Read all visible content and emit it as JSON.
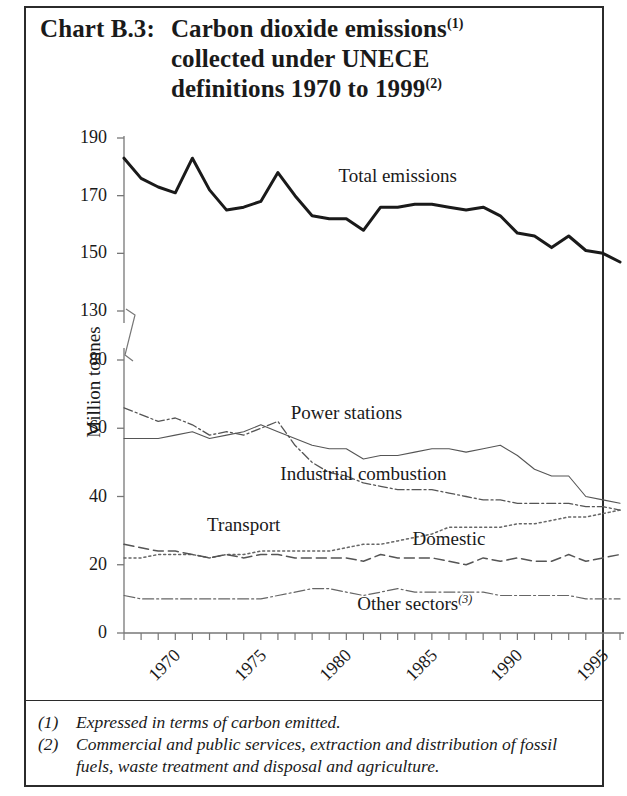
{
  "title": {
    "chart_label": "Chart B.3:",
    "line1": "Carbon dioxide emissions",
    "line1_sup": "(1)",
    "line2": "collected under UNECE",
    "line3": "definitions 1970 to 1999",
    "line3_sup": "(2)"
  },
  "footnotes": [
    {
      "num": "(1)",
      "text": "Expressed in terms of carbon emitted."
    },
    {
      "num": "(2)",
      "text": "Commercial and public services, extraction and distribution of fossil fuels, waste treatment and disposal and agriculture."
    }
  ],
  "chart_data": {
    "type": "line",
    "xlabel": "",
    "ylabel": "Million tonnes",
    "grid": false,
    "legend": "inline-annotations",
    "axis_break": {
      "between": [
        130,
        80
      ],
      "note": "y-axis broken between 80 and 130"
    },
    "upper_panel": {
      "ylim": [
        130,
        190
      ],
      "yticks": [
        130,
        150,
        170,
        190
      ]
    },
    "lower_panel": {
      "ylim": [
        0,
        80
      ],
      "yticks": [
        0,
        20,
        40,
        60,
        80
      ]
    },
    "xlim": [
      1970,
      1999
    ],
    "xticks": [
      1970,
      1975,
      1980,
      1985,
      1990,
      1995,
      1999
    ],
    "xticklabels": [
      "1970",
      "1975",
      "1980",
      "1985",
      "1990",
      "1995",
      "1999 prov"
    ],
    "x": [
      1970,
      1971,
      1972,
      1973,
      1974,
      1975,
      1976,
      1977,
      1978,
      1979,
      1980,
      1981,
      1982,
      1983,
      1984,
      1985,
      1986,
      1987,
      1988,
      1989,
      1990,
      1991,
      1992,
      1993,
      1994,
      1995,
      1996,
      1997,
      1998,
      1999
    ],
    "series": [
      {
        "name": "Total emissions",
        "panel": "upper",
        "style": "solid-thick",
        "values": [
          183,
          176,
          173,
          171,
          183,
          172,
          165,
          166,
          168,
          178,
          170,
          163,
          162,
          162,
          158,
          166,
          166,
          167,
          167,
          166,
          165,
          166,
          163,
          157,
          156,
          152,
          156,
          151,
          150,
          147
        ]
      },
      {
        "name": "Power stations",
        "panel": "lower",
        "style": "solid-thin",
        "values": [
          57,
          57,
          57,
          58,
          59,
          57,
          58,
          59,
          61,
          59,
          57,
          55,
          54,
          54,
          51,
          52,
          52,
          53,
          54,
          54,
          53,
          54,
          55,
          52,
          48,
          46,
          46,
          40,
          39,
          38
        ]
      },
      {
        "name": "Industrial combustion",
        "panel": "lower",
        "style": "dash-dot",
        "values": [
          66,
          64,
          62,
          63,
          61,
          58,
          59,
          58,
          60,
          62,
          55,
          50,
          47,
          46,
          44,
          43,
          42,
          42,
          42,
          41,
          40,
          39,
          39,
          38,
          38,
          38,
          38,
          37,
          37,
          36
        ]
      },
      {
        "name": "Transport",
        "panel": "lower",
        "style": "dotted",
        "values": [
          22,
          22,
          23,
          23,
          23,
          22,
          23,
          23,
          24,
          24,
          24,
          24,
          24,
          25,
          26,
          26,
          27,
          28,
          29,
          31,
          31,
          31,
          31,
          32,
          32,
          33,
          34,
          34,
          35,
          36
        ]
      },
      {
        "name": "Domestic",
        "panel": "lower",
        "style": "dashed",
        "values": [
          26,
          25,
          24,
          24,
          23,
          22,
          23,
          22,
          23,
          23,
          22,
          22,
          22,
          22,
          21,
          23,
          22,
          22,
          22,
          21,
          20,
          22,
          21,
          22,
          21,
          21,
          23,
          21,
          22,
          23
        ]
      },
      {
        "name": "Other sectors",
        "panel": "lower",
        "style": "dash-dot-thin",
        "note_sup": "(3)",
        "values": [
          11,
          10,
          10,
          10,
          10,
          10,
          10,
          10,
          10,
          11,
          12,
          13,
          13,
          12,
          11,
          12,
          13,
          12,
          12,
          12,
          12,
          12,
          11,
          11,
          11,
          11,
          11,
          10,
          10,
          10
        ]
      }
    ],
    "annotations": [
      {
        "text": "Total emissions",
        "x": 1986,
        "y": 176,
        "panel": "upper"
      },
      {
        "text": "Power stations",
        "x": 1983,
        "y": 64,
        "panel": "lower"
      },
      {
        "text": "Industrial combustion",
        "x": 1984,
        "y": 46,
        "panel": "lower"
      },
      {
        "text": "Transport",
        "x": 1977,
        "y": 31,
        "panel": "lower"
      },
      {
        "text": "Domestic",
        "x": 1989,
        "y": 27,
        "panel": "lower"
      },
      {
        "text": "Other sectors",
        "x": 1987,
        "y": 8,
        "panel": "lower"
      }
    ]
  },
  "labels": {
    "total_emissions": "Total emissions",
    "power_stations": "Power stations",
    "industrial_combustion": "Industrial combustion",
    "transport": "Transport",
    "domestic": "Domestic",
    "other_sectors": "Other sectors",
    "other_sectors_sup": "(3)",
    "ylabel": "Million tonnes"
  }
}
